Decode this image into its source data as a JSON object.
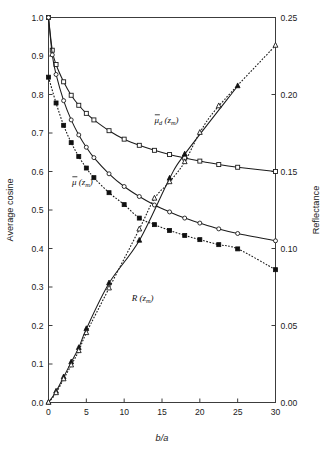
{
  "chart_data": {
    "type": "line",
    "title": "",
    "xlabel": "b/a",
    "ylabel": "Average cosine",
    "y2label": "Reflectance",
    "xlim": [
      0,
      30
    ],
    "ylim": [
      0.0,
      1.0
    ],
    "y2lim": [
      0.0,
      0.25
    ],
    "grid": false,
    "legend": "inline-annotations",
    "xticks": [
      "0",
      "5",
      "10",
      "15",
      "20",
      "25",
      "30"
    ],
    "xtick_values": [
      0,
      5,
      10,
      15,
      20,
      25,
      30
    ],
    "yticks": [
      "0.0",
      "0.1",
      "0.2",
      "0.3",
      "0.4",
      "0.5",
      "0.6",
      "0.7",
      "0.8",
      "0.9",
      "1.0"
    ],
    "ytick_values": [
      0.0,
      0.1,
      0.2,
      0.3,
      0.4,
      0.5,
      0.6,
      0.7,
      0.8,
      0.9,
      1.0
    ],
    "y2ticks": [
      "0.00",
      "0.05",
      "0.10",
      "0.15",
      "0.20",
      "0.25"
    ],
    "y2tick_values": [
      0.0,
      0.05,
      0.1,
      0.15,
      0.2,
      0.25
    ],
    "annotations": [
      {
        "name": "mu-d-label",
        "text": "μ",
        "bar": true,
        "sub": "d",
        "arg": "(z",
        "argsub": "m",
        "argend": ")",
        "x": 14.0,
        "y": 0.726
      },
      {
        "name": "mu-label",
        "text": "μ",
        "bar": true,
        "sub": "",
        "arg": "(z",
        "argsub": "m",
        "argend": ")",
        "x": 3.1,
        "y": 0.565
      },
      {
        "name": "r-label",
        "text": "R",
        "bar": false,
        "sub": "",
        "arg": "(z",
        "argsub": "m",
        "argend": ")",
        "x": 11.0,
        "y": 0.263
      }
    ],
    "series": [
      {
        "name": "mu_d(z_m)",
        "label": "μ̄_d(z_m)",
        "marker": "open-square",
        "axis": "left",
        "linestyle": "solid",
        "x": [
          0.0,
          0.5,
          1.0,
          2.0,
          3.0,
          4.0,
          5.0,
          6.0,
          8.0,
          10.0,
          12.0,
          14.0,
          16.0,
          18.0,
          20.0,
          22.5,
          25.0,
          30.0
        ],
        "y": [
          1.0,
          0.915,
          0.878,
          0.833,
          0.798,
          0.772,
          0.751,
          0.734,
          0.706,
          0.684,
          0.668,
          0.655,
          0.644,
          0.635,
          0.627,
          0.618,
          0.611,
          0.6
        ]
      },
      {
        "name": "mu(z_m)-open",
        "label": "μ̄(z_m)",
        "marker": "open-circle",
        "axis": "left",
        "linestyle": "solid",
        "x": [
          0.0,
          0.5,
          1.0,
          2.0,
          3.0,
          4.0,
          5.0,
          6.0,
          8.0,
          10.0,
          12.0,
          14.0,
          16.0,
          18.0,
          20.0,
          22.5,
          25.0,
          30.0
        ],
        "y": [
          1.0,
          0.903,
          0.852,
          0.784,
          0.734,
          0.695,
          0.663,
          0.636,
          0.594,
          0.561,
          0.535,
          0.513,
          0.495,
          0.479,
          0.466,
          0.451,
          0.439,
          0.42
        ]
      },
      {
        "name": "mu(z_m)-filled",
        "label": "μ̄(z_m)",
        "marker": "filled-square",
        "axis": "left",
        "linestyle": "dotted",
        "x": [
          0.0,
          1.0,
          2.0,
          3.0,
          4.0,
          5.0,
          6.0,
          8.0,
          10.0,
          12.0,
          14.0,
          16.0,
          18.0,
          20.0,
          22.5,
          25.0,
          30.0
        ],
        "y": [
          0.845,
          0.778,
          0.72,
          0.675,
          0.639,
          0.609,
          0.584,
          0.545,
          0.514,
          0.479,
          0.462,
          0.447,
          0.434,
          0.423,
          0.41,
          0.399,
          0.345
        ]
      },
      {
        "name": "R(z_m)-filled",
        "label": "R(z_m)",
        "marker": "filled-triangle",
        "axis": "right",
        "linestyle": "solid",
        "x": [
          0.0,
          1.0,
          2.0,
          3.0,
          4.0,
          5.0,
          8.0,
          12.0,
          16.0,
          18.0,
          25.0
        ],
        "y": [
          0.0,
          0.0072,
          0.0165,
          0.0262,
          0.0355,
          0.0478,
          0.0775,
          0.1052,
          0.1455,
          0.1612,
          0.2055
        ]
      },
      {
        "name": "R(z_m)-open",
        "label": "R(z_m)",
        "marker": "open-triangle",
        "axis": "right",
        "linestyle": "dashed",
        "x": [
          0.0,
          1.0,
          2.0,
          3.0,
          4.0,
          5.0,
          8.0,
          12.0,
          14.0,
          16.0,
          18.0,
          20.0,
          22.5,
          30.0
        ],
        "y": [
          0.0,
          0.0062,
          0.0152,
          0.0242,
          0.0335,
          0.0452,
          0.0742,
          0.1125,
          0.1325,
          0.1432,
          0.1562,
          0.1752,
          0.1925,
          0.2318
        ]
      }
    ]
  },
  "axes": {
    "left_title": "Average cosine",
    "right_title": "Reflectance",
    "bottom_title": "b/a"
  }
}
